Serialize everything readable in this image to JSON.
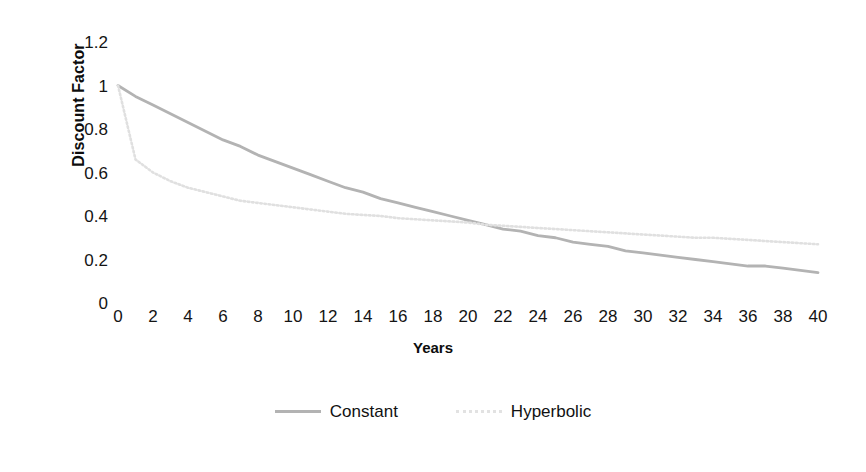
{
  "chart_data": {
    "type": "line",
    "title": "",
    "xlabel": "Years",
    "ylabel": "Discount Factor",
    "xlim": [
      0,
      40
    ],
    "ylim": [
      0,
      1.2
    ],
    "grid": false,
    "legend_position": "bottom",
    "x_tick_labels": [
      "0",
      "2",
      "4",
      "6",
      "8",
      "10",
      "12",
      "14",
      "16",
      "18",
      "20",
      "22",
      "24",
      "26",
      "28",
      "30",
      "32",
      "34",
      "36",
      "38",
      "40"
    ],
    "y_tick_labels": [
      "1.2",
      "1",
      "0.8",
      "0.6",
      "0.4",
      "0.2",
      "0"
    ],
    "x_ticks": [
      0,
      2,
      4,
      6,
      8,
      10,
      12,
      14,
      16,
      18,
      20,
      22,
      24,
      26,
      28,
      30,
      32,
      34,
      36,
      38,
      40
    ],
    "y_ticks": [
      1.2,
      1,
      0.8,
      0.6,
      0.4,
      0.2,
      0
    ],
    "x": [
      0,
      1,
      2,
      3,
      4,
      5,
      6,
      7,
      8,
      9,
      10,
      11,
      12,
      13,
      14,
      15,
      16,
      17,
      18,
      19,
      20,
      21,
      22,
      23,
      24,
      25,
      26,
      27,
      28,
      29,
      30,
      31,
      32,
      33,
      34,
      35,
      36,
      37,
      38,
      39,
      40
    ],
    "series": [
      {
        "name": "Constant",
        "color": "#b3b3b3",
        "style": "solid",
        "values": [
          1.0,
          0.95,
          0.91,
          0.87,
          0.83,
          0.79,
          0.75,
          0.72,
          0.68,
          0.65,
          0.62,
          0.59,
          0.56,
          0.53,
          0.51,
          0.48,
          0.46,
          0.44,
          0.42,
          0.4,
          0.38,
          0.36,
          0.34,
          0.33,
          0.31,
          0.3,
          0.28,
          0.27,
          0.26,
          0.24,
          0.23,
          0.22,
          0.21,
          0.2,
          0.19,
          0.18,
          0.17,
          0.17,
          0.16,
          0.15,
          0.14
        ]
      },
      {
        "name": "Hyperbolic",
        "color": "#e0e0e0",
        "style": "dotted",
        "values": [
          1.0,
          0.66,
          0.6,
          0.56,
          0.53,
          0.51,
          0.49,
          0.47,
          0.46,
          0.45,
          0.44,
          0.43,
          0.42,
          0.41,
          0.405,
          0.4,
          0.39,
          0.385,
          0.38,
          0.375,
          0.37,
          0.36,
          0.355,
          0.35,
          0.345,
          0.34,
          0.335,
          0.33,
          0.325,
          0.32,
          0.315,
          0.31,
          0.305,
          0.3,
          0.3,
          0.295,
          0.29,
          0.285,
          0.28,
          0.275,
          0.27
        ]
      }
    ]
  },
  "legend": {
    "entries": [
      {
        "label": "Constant"
      },
      {
        "label": "Hyperbolic"
      }
    ]
  },
  "axes": {
    "y_title": "Discount Factor",
    "x_title": "Years"
  },
  "colors": {
    "constant": "#b3b3b3",
    "hyperbolic": "#e0e0e0",
    "text": "#141414",
    "background": "#ffffff"
  }
}
